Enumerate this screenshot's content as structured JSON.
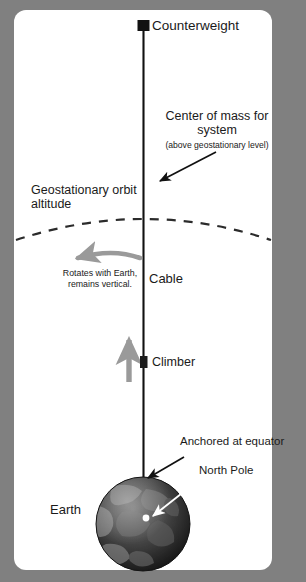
{
  "figure": {
    "background_color": "#808080",
    "panel_color": "#ffffff",
    "ink_color": "#1a1a1a",
    "accent_gray": "#9a9a9a"
  },
  "labels": {
    "counterweight": "Counterweight",
    "center_of_mass": "Center of mass\nfor system",
    "center_of_mass_note": "(above geostationary level)",
    "geostationary": "Geostationary\norbit altitude",
    "rotates": "Rotates with Earth,\nremains vertical.",
    "cable": "Cable",
    "climber": "Climber",
    "anchored": "Anchored at equator",
    "north_pole": "North Pole",
    "earth": "Earth"
  },
  "elements": {
    "counterweight_marker": "black-square",
    "climber_marker": "dark-rectangle",
    "cable": "vertical-black-line",
    "geostationary_arc": "dashed-arc",
    "rotation_arrow": "gray-curved-arrow-left",
    "climber_arrow": "gray-up-arrow",
    "com_arrow": "black-arrow-down-left",
    "anchor_arrow": "black-arrow-down-left",
    "north_pole_arrow": "white-arrow-down-left",
    "earth_globe": "textured-dark-sphere",
    "north_pole_dot": "white-dot"
  }
}
